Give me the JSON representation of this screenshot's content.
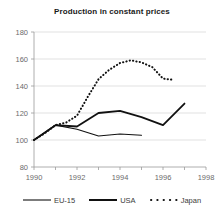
{
  "chart_data": {
    "type": "line",
    "title": "Production in constant prices",
    "xlabel": "",
    "ylabel": "",
    "xlim": [
      1990,
      1998
    ],
    "ylim": [
      80,
      180
    ],
    "yticks": [
      80,
      100,
      120,
      140,
      160,
      180
    ],
    "xticks": [
      1990,
      1992,
      1994,
      1996,
      1998
    ],
    "grid": true,
    "legend_position": "bottom",
    "series": [
      {
        "name": "EU-15",
        "style": "solid-thin",
        "x": [
          1990,
          1991,
          1992,
          1993,
          1994,
          1995
        ],
        "values": [
          100,
          111,
          108,
          103,
          104.5,
          103.5
        ]
      },
      {
        "name": "USA",
        "style": "solid-thick",
        "x": [
          1990,
          1991,
          1992,
          1993,
          1994,
          1995,
          1996,
          1997
        ],
        "values": [
          100,
          111,
          110,
          120,
          121.5,
          117,
          111,
          127
        ]
      },
      {
        "name": "Japan",
        "style": "dotted",
        "x": [
          1990,
          1990.5,
          1991,
          1991.5,
          1992,
          1992.5,
          1993,
          1993.5,
          1994,
          1994.5,
          1995,
          1995.5,
          1996,
          1996.5
        ],
        "values": [
          100,
          105,
          111,
          113,
          118,
          132,
          145,
          152,
          157,
          159,
          157.5,
          154,
          145.5,
          144.5
        ]
      }
    ]
  },
  "axes": {
    "ylabels": [
      "180",
      "160",
      "140",
      "120",
      "100",
      "80"
    ],
    "xlabels": [
      "1990",
      "1992",
      "1994",
      "1996",
      "1998"
    ]
  },
  "legend": {
    "entries": [
      {
        "label": "EU-15"
      },
      {
        "label": "USA"
      },
      {
        "label": "Japan"
      }
    ]
  },
  "colors": {
    "line": "#111111",
    "grid": "#d4d4d4",
    "axis": "#9a9a9a",
    "tick_text": "#6b6b6b",
    "title_text": "#1a1a1a",
    "background": "#ffffff"
  }
}
